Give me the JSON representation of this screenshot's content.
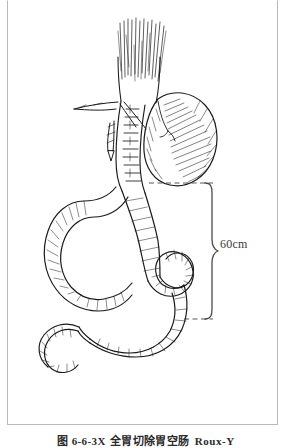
{
  "figure": {
    "frame_color": "#b9b9b9",
    "background": "#ffffff",
    "ink_color": "#1a1a1a"
  },
  "illustration": {
    "title": "Total gastrectomy with Roux-en-Y esophagojejunostomy",
    "style": "pen-and-ink medical line drawing with hatching",
    "structures": [
      "esophagus-with-vagal-fibers",
      "gastric-remnant-pouch",
      "esophagojejunal-anastomosis-suture-line",
      "ligated-vessel-stump-with-clips",
      "jejunal-limb-upper-loop",
      "jejunal-limb-crossing-loop",
      "jejunal-limb-distal-segment"
    ]
  },
  "measurement": {
    "brace_label": "60cm",
    "brace_color": "#4a4a4a",
    "guide_line_style": "dashed",
    "guide_line_color": "#3a3a3a"
  },
  "caption": {
    "number": "图 6-6-3X",
    "text": "全胃切除胃空肠",
    "latin": "Roux-Y"
  }
}
